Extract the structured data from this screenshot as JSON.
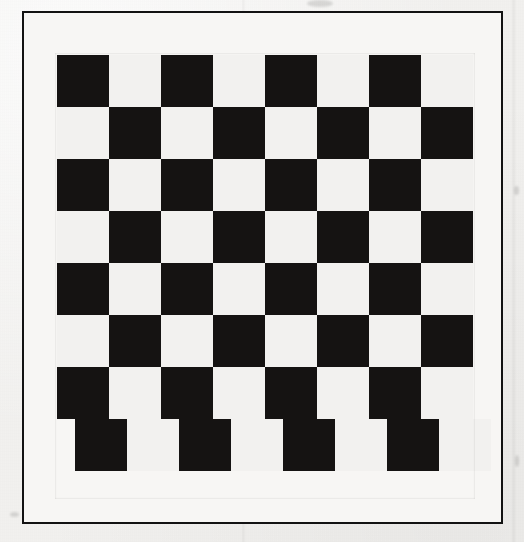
{
  "page": {
    "background_color": "#f3f2f0",
    "width": 524,
    "height": 542
  },
  "frame": {
    "name": "outer-rule",
    "stroke_color": "#121212",
    "stroke_width_px": 2,
    "x": 22,
    "y": 11,
    "width": 481,
    "height": 513,
    "fill_color": "#f7f6f4"
  },
  "board": {
    "name": "checkerboard",
    "x": 57,
    "y": 55,
    "columns": 8,
    "rows": 8,
    "cell_size_px": 52,
    "dark_color": "#151312",
    "light_color": "#f2f1ef",
    "top_left_cell": "dark",
    "note_bottom_row_offset_px": 18,
    "rows_data": [
      {
        "offset_x": 0,
        "cells": [
          "dark",
          "light",
          "dark",
          "light",
          "dark",
          "light",
          "dark",
          "light"
        ]
      },
      {
        "offset_x": 0,
        "cells": [
          "light",
          "dark",
          "light",
          "dark",
          "light",
          "dark",
          "light",
          "dark"
        ]
      },
      {
        "offset_x": 0,
        "cells": [
          "dark",
          "light",
          "dark",
          "light",
          "dark",
          "light",
          "dark",
          "light"
        ]
      },
      {
        "offset_x": 0,
        "cells": [
          "light",
          "dark",
          "light",
          "dark",
          "light",
          "dark",
          "light",
          "dark"
        ]
      },
      {
        "offset_x": 0,
        "cells": [
          "dark",
          "light",
          "dark",
          "light",
          "dark",
          "light",
          "dark",
          "light"
        ]
      },
      {
        "offset_x": 0,
        "cells": [
          "light",
          "dark",
          "light",
          "dark",
          "light",
          "dark",
          "light",
          "dark"
        ]
      },
      {
        "offset_x": 0,
        "cells": [
          "dark",
          "light",
          "dark",
          "light",
          "dark",
          "light",
          "dark",
          "light"
        ]
      },
      {
        "offset_x": 18,
        "cells": [
          "dark",
          "light",
          "dark",
          "light",
          "dark",
          "light",
          "dark",
          "light"
        ]
      }
    ]
  },
  "artifacts": {
    "smudges": [
      {
        "name": "smudge-top",
        "x": 307,
        "y": 0,
        "w": 26,
        "h": 7
      },
      {
        "name": "smudge-right-upper",
        "x": 514,
        "y": 186,
        "w": 5,
        "h": 9
      },
      {
        "name": "smudge-right-lower",
        "x": 515,
        "y": 455,
        "w": 4,
        "h": 12
      },
      {
        "name": "smudge-bottom-left",
        "x": 10,
        "y": 512,
        "w": 9,
        "h": 5
      }
    ]
  }
}
